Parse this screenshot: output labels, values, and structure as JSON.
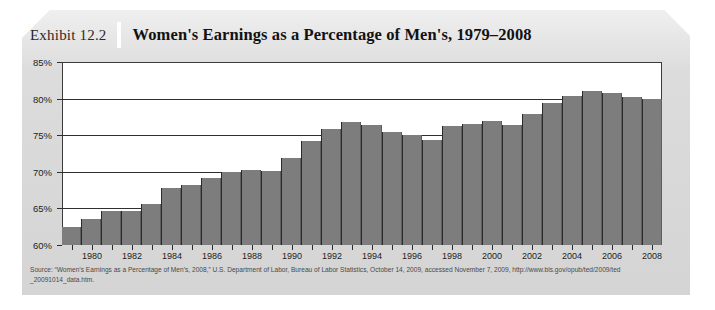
{
  "exhibit": {
    "label": "Exhibit 12.2",
    "title": "Women's Earnings as a Percentage of Men's, 1979–2008"
  },
  "source": {
    "line1": "Source: “Women’s Earnings as a Percentage of Men’s, 2008,” U.S. Department of Labor, Bureau of Labor Statistics, October 14, 2009, accessed November 7, 2009, http://www.bls.gov/opub/ted/2009/ted",
    "line2": "_20091014_data.htm."
  },
  "colors": {
    "card_background": "#dcdcdc",
    "bar_fill": "#7d7d7d",
    "bar_edge": "#2b2b2b",
    "plot_background": "#ffffff",
    "axis": "#3b3b3b",
    "text": "#1d1d1d"
  },
  "chart_data": {
    "type": "bar",
    "title": "Women's Earnings as a Percentage of Men's, 1979–2008",
    "xlabel": "",
    "ylabel": "",
    "ylim": [
      60,
      85
    ],
    "yticks": [
      60,
      65,
      70,
      75,
      80,
      85
    ],
    "ytick_labels": [
      "60%",
      "65%",
      "70%",
      "75%",
      "80%",
      "85%"
    ],
    "grid": true,
    "legend": "none",
    "xtick_labels": [
      "1980",
      "1982",
      "1984",
      "1986",
      "1988",
      "1990",
      "1992",
      "1994",
      "1996",
      "1998",
      "2000",
      "2002",
      "2004",
      "2006",
      "2008"
    ],
    "categories": [
      1979,
      1980,
      1981,
      1982,
      1983,
      1984,
      1985,
      1986,
      1987,
      1988,
      1989,
      1990,
      1991,
      1992,
      1993,
      1994,
      1995,
      1996,
      1997,
      1998,
      1999,
      2000,
      2001,
      2002,
      2003,
      2004,
      2005,
      2006,
      2007,
      2008
    ],
    "values": [
      62.5,
      63.6,
      64.6,
      64.6,
      65.6,
      67.8,
      68.2,
      69.2,
      70.0,
      70.2,
      70.1,
      71.9,
      74.2,
      75.8,
      76.8,
      76.4,
      75.5,
      75.0,
      74.4,
      76.3,
      76.5,
      76.9,
      76.4,
      77.9,
      79.4,
      80.4,
      81.0,
      80.8,
      80.2,
      79.9
    ],
    "value_unit": "percent"
  }
}
